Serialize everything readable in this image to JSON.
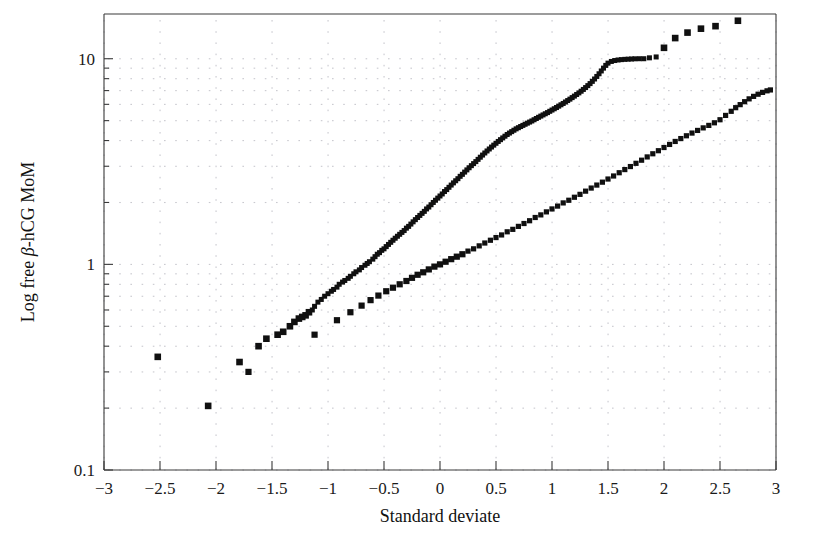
{
  "chart_data": {
    "type": "scatter",
    "title": "",
    "subtitle": "",
    "xlabel": "Standard deviate",
    "ylabel": "Log free β-hCG MoM",
    "ylabel_parts": {
      "prefix": "Log free ",
      "symbol": "β",
      "suffix": "-hCG MoM"
    },
    "xlim": [
      -3,
      3
    ],
    "ylim": [
      0.1,
      16.5
    ],
    "yscale": "log",
    "xscale": "linear",
    "grid": true,
    "grid_style": "dotted",
    "legend": "none",
    "legend_position": "none",
    "xticks": [
      -3,
      -2.5,
      -2,
      -1.5,
      -1,
      -0.5,
      0,
      0.5,
      1,
      1.5,
      2,
      2.5,
      3
    ],
    "xticklabels": [
      "−3",
      "−2.5",
      "−2",
      "−1.5",
      "−1",
      "−0.5",
      "0",
      "0.5",
      "1",
      "1.5",
      "2",
      "2.5",
      "3"
    ],
    "yticks": [
      0.1,
      1,
      10
    ],
    "yticklabels": [
      "0.1",
      "1",
      "10"
    ],
    "y_minor_ticks": [
      0.2,
      0.3,
      0.4,
      0.5,
      0.6,
      0.7,
      0.8,
      0.9,
      2,
      3,
      4,
      5,
      6,
      7,
      8,
      9,
      20
    ],
    "marker_shape": "square",
    "marker_color": "#101010",
    "series": [
      {
        "name": "upper",
        "label": "Affected (Down syndrome) cases",
        "marker": "filled-square",
        "color": "#101010",
        "points": [
          [
            -2.07,
            0.205
          ],
          [
            -2.52,
            0.355
          ],
          [
            -1.79,
            0.335
          ],
          [
            -1.62,
            0.4
          ],
          [
            -1.55,
            0.435
          ],
          [
            -1.45,
            0.455
          ],
          [
            -1.4,
            0.47
          ],
          [
            -1.34,
            0.5
          ],
          [
            -1.3,
            0.525
          ],
          [
            -1.26,
            0.545
          ],
          [
            -1.23,
            0.555
          ],
          [
            -1.2,
            0.565
          ],
          [
            -1.17,
            0.585
          ],
          [
            -1.14,
            0.6
          ],
          [
            -1.12,
            0.625
          ],
          [
            -1.09,
            0.655
          ],
          [
            -1.06,
            0.675
          ],
          [
            -1.03,
            0.7
          ],
          [
            -1.0,
            0.72
          ],
          [
            -0.97,
            0.74
          ],
          [
            -0.95,
            0.755
          ],
          [
            -0.92,
            0.775
          ],
          [
            -0.9,
            0.8
          ],
          [
            -0.87,
            0.82
          ],
          [
            -0.85,
            0.835
          ],
          [
            -0.82,
            0.855
          ],
          [
            -0.8,
            0.875
          ],
          [
            -0.77,
            0.9
          ],
          [
            -0.75,
            0.92
          ],
          [
            -0.72,
            0.94
          ],
          [
            -0.7,
            0.965
          ],
          [
            -0.67,
            0.99
          ],
          [
            -0.65,
            1.01
          ],
          [
            -0.63,
            1.03
          ],
          [
            -0.6,
            1.06
          ],
          [
            -0.58,
            1.09
          ],
          [
            -0.56,
            1.12
          ],
          [
            -0.54,
            1.14
          ],
          [
            -0.52,
            1.17
          ],
          [
            -0.5,
            1.19
          ],
          [
            -0.48,
            1.22
          ],
          [
            -0.46,
            1.25
          ],
          [
            -0.44,
            1.28
          ],
          [
            -0.42,
            1.31
          ],
          [
            -0.4,
            1.34
          ],
          [
            -0.38,
            1.37
          ],
          [
            -0.36,
            1.4
          ],
          [
            -0.34,
            1.43
          ],
          [
            -0.32,
            1.46
          ],
          [
            -0.3,
            1.5
          ],
          [
            -0.28,
            1.53
          ],
          [
            -0.26,
            1.57
          ],
          [
            -0.24,
            1.61
          ],
          [
            -0.22,
            1.65
          ],
          [
            -0.2,
            1.69
          ],
          [
            -0.18,
            1.73
          ],
          [
            -0.16,
            1.77
          ],
          [
            -0.14,
            1.81
          ],
          [
            -0.12,
            1.86
          ],
          [
            -0.1,
            1.9
          ],
          [
            -0.08,
            1.95
          ],
          [
            -0.06,
            2.0
          ],
          [
            -0.04,
            2.05
          ],
          [
            -0.02,
            2.1
          ],
          [
            0.0,
            2.15
          ],
          [
            0.02,
            2.2
          ],
          [
            0.04,
            2.26
          ],
          [
            0.06,
            2.31
          ],
          [
            0.08,
            2.37
          ],
          [
            0.1,
            2.43
          ],
          [
            0.12,
            2.49
          ],
          [
            0.14,
            2.55
          ],
          [
            0.16,
            2.61
          ],
          [
            0.18,
            2.68
          ],
          [
            0.2,
            2.74
          ],
          [
            0.22,
            2.81
          ],
          [
            0.24,
            2.88
          ],
          [
            0.26,
            2.95
          ],
          [
            0.28,
            3.02
          ],
          [
            0.3,
            3.09
          ],
          [
            0.32,
            3.16
          ],
          [
            0.34,
            3.24
          ],
          [
            0.36,
            3.32
          ],
          [
            0.38,
            3.4
          ],
          [
            0.4,
            3.48
          ],
          [
            0.42,
            3.56
          ],
          [
            0.44,
            3.64
          ],
          [
            0.46,
            3.72
          ],
          [
            0.48,
            3.8
          ],
          [
            0.5,
            3.88
          ],
          [
            0.52,
            3.96
          ],
          [
            0.54,
            4.04
          ],
          [
            0.56,
            4.12
          ],
          [
            0.58,
            4.2
          ],
          [
            0.6,
            4.28
          ],
          [
            0.62,
            4.35
          ],
          [
            0.64,
            4.42
          ],
          [
            0.66,
            4.49
          ],
          [
            0.68,
            4.56
          ],
          [
            0.7,
            4.62
          ],
          [
            0.72,
            4.68
          ],
          [
            0.74,
            4.74
          ],
          [
            0.76,
            4.8
          ],
          [
            0.78,
            4.86
          ],
          [
            0.8,
            4.92
          ],
          [
            0.82,
            4.98
          ],
          [
            0.84,
            5.05
          ],
          [
            0.86,
            5.12
          ],
          [
            0.88,
            5.19
          ],
          [
            0.9,
            5.26
          ],
          [
            0.92,
            5.33
          ],
          [
            0.94,
            5.4
          ],
          [
            0.96,
            5.47
          ],
          [
            0.98,
            5.55
          ],
          [
            1.0,
            5.63
          ],
          [
            1.02,
            5.71
          ],
          [
            1.04,
            5.79
          ],
          [
            1.06,
            5.88
          ],
          [
            1.08,
            5.97
          ],
          [
            1.1,
            6.06
          ],
          [
            1.12,
            6.16
          ],
          [
            1.14,
            6.26
          ],
          [
            1.16,
            6.36
          ],
          [
            1.18,
            6.47
          ],
          [
            1.2,
            6.58
          ],
          [
            1.22,
            6.7
          ],
          [
            1.24,
            6.82
          ],
          [
            1.26,
            6.95
          ],
          [
            1.28,
            7.09
          ],
          [
            1.3,
            7.24
          ],
          [
            1.32,
            7.4
          ],
          [
            1.34,
            7.57
          ],
          [
            1.36,
            7.76
          ],
          [
            1.38,
            7.97
          ],
          [
            1.4,
            8.2
          ],
          [
            1.42,
            8.45
          ],
          [
            1.44,
            8.72
          ],
          [
            1.46,
            9.0
          ],
          [
            1.48,
            9.28
          ],
          [
            1.5,
            9.52
          ],
          [
            1.53,
            9.7
          ],
          [
            1.56,
            9.8
          ],
          [
            1.59,
            9.86
          ],
          [
            1.62,
            9.9
          ],
          [
            1.65,
            9.93
          ],
          [
            1.68,
            9.95
          ],
          [
            1.71,
            9.97
          ],
          [
            1.74,
            9.99
          ],
          [
            1.78,
            10.0
          ],
          [
            1.82,
            10.0
          ],
          [
            1.87,
            10.1
          ],
          [
            1.93,
            10.2
          ],
          [
            2.0,
            11.3
          ],
          [
            2.1,
            12.6
          ],
          [
            2.21,
            13.4
          ],
          [
            2.33,
            14.0
          ],
          [
            2.46,
            14.4
          ],
          [
            2.66,
            15.3
          ]
        ]
      },
      {
        "name": "lower",
        "label": "Unaffected controls",
        "marker": "filled-square",
        "color": "#101010",
        "points": [
          [
            -1.71,
            0.3
          ],
          [
            -1.12,
            0.455
          ],
          [
            -0.92,
            0.535
          ],
          [
            -0.8,
            0.585
          ],
          [
            -0.7,
            0.63
          ],
          [
            -0.62,
            0.67
          ],
          [
            -0.55,
            0.705
          ],
          [
            -0.48,
            0.74
          ],
          [
            -0.42,
            0.77
          ],
          [
            -0.36,
            0.8
          ],
          [
            -0.3,
            0.83
          ],
          [
            -0.25,
            0.86
          ],
          [
            -0.2,
            0.89
          ],
          [
            -0.15,
            0.915
          ],
          [
            -0.1,
            0.945
          ],
          [
            -0.05,
            0.975
          ],
          [
            0.0,
            1.0
          ],
          [
            0.05,
            1.03
          ],
          [
            0.1,
            1.06
          ],
          [
            0.15,
            1.09
          ],
          [
            0.2,
            1.12
          ],
          [
            0.25,
            1.16
          ],
          [
            0.3,
            1.19
          ],
          [
            0.35,
            1.23
          ],
          [
            0.4,
            1.27
          ],
          [
            0.45,
            1.31
          ],
          [
            0.5,
            1.35
          ],
          [
            0.55,
            1.39
          ],
          [
            0.6,
            1.44
          ],
          [
            0.65,
            1.48
          ],
          [
            0.7,
            1.53
          ],
          [
            0.75,
            1.58
          ],
          [
            0.8,
            1.63
          ],
          [
            0.85,
            1.69
          ],
          [
            0.9,
            1.74
          ],
          [
            0.95,
            1.8
          ],
          [
            1.0,
            1.86
          ],
          [
            1.05,
            1.92
          ],
          [
            1.1,
            1.99
          ],
          [
            1.15,
            2.05
          ],
          [
            1.2,
            2.12
          ],
          [
            1.25,
            2.19
          ],
          [
            1.3,
            2.27
          ],
          [
            1.35,
            2.35
          ],
          [
            1.4,
            2.43
          ],
          [
            1.45,
            2.51
          ],
          [
            1.5,
            2.6
          ],
          [
            1.55,
            2.69
          ],
          [
            1.6,
            2.79
          ],
          [
            1.65,
            2.89
          ],
          [
            1.7,
            2.99
          ],
          [
            1.75,
            3.1
          ],
          [
            1.8,
            3.21
          ],
          [
            1.85,
            3.33
          ],
          [
            1.9,
            3.45
          ],
          [
            1.95,
            3.57
          ],
          [
            2.0,
            3.7
          ],
          [
            2.05,
            3.83
          ],
          [
            2.1,
            3.96
          ],
          [
            2.15,
            4.09
          ],
          [
            2.2,
            4.22
          ],
          [
            2.25,
            4.35
          ],
          [
            2.3,
            4.48
          ],
          [
            2.35,
            4.61
          ],
          [
            2.4,
            4.74
          ],
          [
            2.45,
            4.88
          ],
          [
            2.5,
            5.05
          ],
          [
            2.55,
            5.3
          ],
          [
            2.6,
            5.55
          ],
          [
            2.64,
            5.78
          ],
          [
            2.68,
            5.98
          ],
          [
            2.72,
            6.18
          ],
          [
            2.76,
            6.38
          ],
          [
            2.8,
            6.56
          ],
          [
            2.84,
            6.72
          ],
          [
            2.88,
            6.86
          ],
          [
            2.92,
            6.98
          ],
          [
            2.95,
            7.05
          ]
        ]
      }
    ]
  }
}
